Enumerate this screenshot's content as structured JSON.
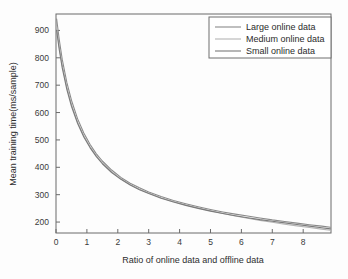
{
  "chart_data": {
    "type": "line",
    "title": "",
    "xlabel": "Ratio of online data and offline data",
    "ylabel": "Mean training time(ms/sample)",
    "xlim": [
      0,
      8.9
    ],
    "ylim": [
      160,
      960
    ],
    "grid": false,
    "legend_position": "top-right",
    "xticks": [
      0,
      1,
      2,
      3,
      4,
      5,
      6,
      7,
      8
    ],
    "xtick_labels": [
      "0",
      "1",
      "2",
      "3",
      "4",
      "5",
      "6",
      "7",
      "8"
    ],
    "yticks": [
      200,
      300,
      400,
      500,
      600,
      700,
      800,
      900
    ],
    "ytick_labels": [
      "200",
      "300",
      "400",
      "500",
      "600",
      "700",
      "800",
      "900"
    ],
    "series": [
      {
        "name": "Large online data",
        "color": "#8a8a8a",
        "x": [
          0.02,
          0.1,
          0.2,
          0.35,
          0.5,
          0.7,
          0.9,
          1.1,
          1.3,
          1.5,
          1.8,
          2.1,
          2.4,
          2.7,
          3.0,
          3.4,
          3.8,
          4.2,
          4.6,
          5.0,
          5.4,
          5.8,
          6.2,
          6.6,
          7.0,
          7.4,
          7.8,
          8.2,
          8.6,
          8.88
        ],
        "y": [
          942,
          870,
          795,
          710,
          645,
          577,
          525,
          484,
          450,
          423,
          390,
          363,
          342,
          325,
          310,
          293,
          279,
          267,
          256,
          246,
          237,
          229,
          222,
          215,
          208,
          202,
          196,
          190,
          185,
          181
        ]
      },
      {
        "name": "Medium online data",
        "color": "#b4b4b4",
        "x": [
          0.02,
          0.1,
          0.2,
          0.35,
          0.5,
          0.7,
          0.9,
          1.1,
          1.3,
          1.5,
          1.8,
          2.1,
          2.4,
          2.7,
          3.0,
          3.4,
          3.8,
          4.2,
          4.6,
          5.0,
          5.4,
          5.8,
          6.2,
          6.6,
          7.0,
          7.4,
          7.8,
          8.2,
          8.6,
          8.88
        ],
        "y": [
          915,
          845,
          775,
          694,
          630,
          565,
          515,
          476,
          443,
          416,
          384,
          358,
          337,
          320,
          306,
          289,
          275,
          262,
          251,
          241,
          231,
          222,
          214,
          206,
          199,
          192,
          186,
          180,
          174,
          170
        ]
      },
      {
        "name": "Small online data",
        "color": "#7a7a7a",
        "x": [
          0.02,
          0.1,
          0.2,
          0.35,
          0.5,
          0.7,
          0.9,
          1.1,
          1.3,
          1.5,
          1.8,
          2.1,
          2.4,
          2.7,
          3.0,
          3.4,
          3.8,
          4.2,
          4.6,
          5.0,
          5.4,
          5.8,
          6.2,
          6.6,
          7.0,
          7.4,
          7.8,
          8.2,
          8.6,
          8.88
        ],
        "y": [
          900,
          833,
          764,
          685,
          623,
          560,
          511,
          472,
          440,
          413,
          381,
          356,
          335,
          318,
          304,
          287,
          273,
          261,
          250,
          240,
          231,
          223,
          216,
          209,
          203,
          197,
          191,
          185,
          179,
          175
        ]
      }
    ]
  },
  "legend": {
    "entries": [
      {
        "label": "Large online data"
      },
      {
        "label": "Medium online data"
      },
      {
        "label": "Small online data"
      }
    ]
  },
  "axes": {
    "x_title": "Ratio of online data and offline data",
    "y_title": "Mean training time(ms/sample)"
  }
}
